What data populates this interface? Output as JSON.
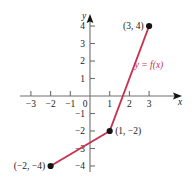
{
  "figure": {
    "background_color": "#ffffff",
    "curve_color": "#c8334d",
    "axis_color": "#6f6f6f",
    "point_color": "#141414",
    "function_label": "y = f(x)",
    "x_axis_name": "x",
    "y_axis_name": "y",
    "origin_label": "0"
  },
  "chart_data": {
    "type": "line",
    "title": "",
    "xlabel": "x",
    "ylabel": "y",
    "xlim": [
      -3.6,
      3.9
    ],
    "ylim": [
      -4.6,
      4.6
    ],
    "grid": false,
    "legend": "y = f(x)",
    "legend_position": "inside-right",
    "series": [
      {
        "name": "y = f(x)",
        "color": "#c8334d",
        "x": [
          -2,
          1,
          3
        ],
        "y": [
          -4,
          -2,
          4
        ]
      }
    ],
    "points": [
      {
        "label": "(3, 4)",
        "x": 3,
        "y": 4,
        "label_side": "left"
      },
      {
        "label": "(1, −2)",
        "x": 1,
        "y": -2,
        "label_side": "right"
      },
      {
        "label": "(−2, −4)",
        "x": -2,
        "y": -4,
        "label_side": "left"
      }
    ],
    "x_ticks": [
      {
        "value": -3,
        "label": "−3"
      },
      {
        "value": -2,
        "label": "−2"
      },
      {
        "value": -1,
        "label": "−1"
      },
      {
        "value": 1,
        "label": "1"
      },
      {
        "value": 2,
        "label": "2"
      },
      {
        "value": 3,
        "label": "3"
      }
    ],
    "y_ticks": [
      {
        "value": 4,
        "label": "4"
      },
      {
        "value": 3,
        "label": "3"
      },
      {
        "value": 2,
        "label": "2"
      },
      {
        "value": 1,
        "label": "1"
      },
      {
        "value": -1,
        "label": "−1"
      },
      {
        "value": -2,
        "label": "−2"
      },
      {
        "value": -3,
        "label": "−3"
      },
      {
        "value": -4,
        "label": "−4"
      }
    ]
  }
}
